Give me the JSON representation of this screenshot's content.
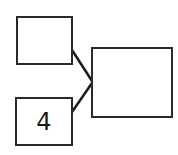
{
  "diagram": {
    "type": "number-bond",
    "parts": [
      {
        "id": "top-part",
        "value": ""
      },
      {
        "id": "bottom-part",
        "value": "4"
      }
    ],
    "whole": {
      "value": ""
    },
    "colors": {
      "stroke": "#2a2a2a",
      "background": "#ffffff"
    }
  }
}
